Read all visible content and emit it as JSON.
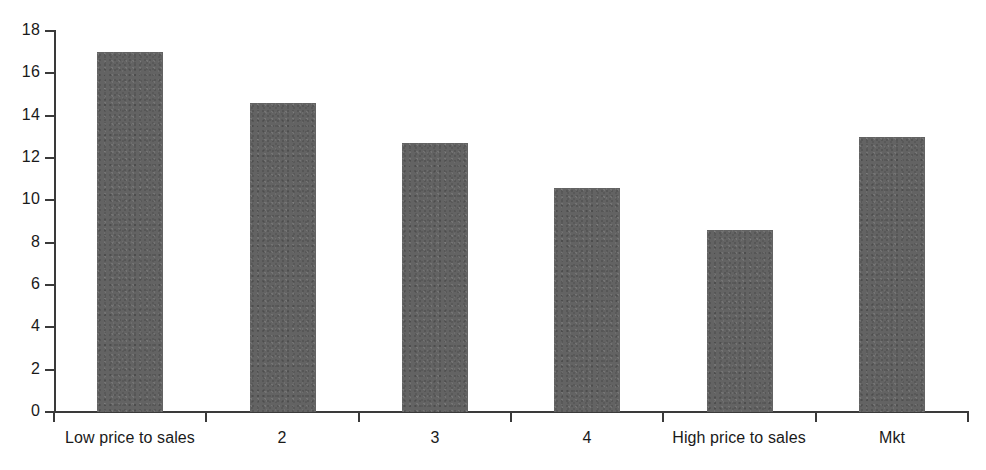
{
  "chart_data": {
    "type": "bar",
    "title": "",
    "subtitle": "",
    "xlabel": "",
    "ylabel": "",
    "categories": [
      "Low price to sales",
      "2",
      "3",
      "4",
      "High price to sales",
      "Mkt"
    ],
    "values": [
      17.0,
      14.6,
      12.7,
      10.6,
      8.6,
      13.0
    ],
    "series": [
      {
        "name": "",
        "values": [
          17.0,
          14.6,
          12.7,
          10.6,
          8.6,
          13.0
        ]
      }
    ],
    "ylim": [
      0,
      18
    ],
    "ytick_labels": [
      "0",
      "2",
      "4",
      "6",
      "8",
      "10",
      "12",
      "14",
      "16",
      "18"
    ],
    "ytick_values": [
      0,
      2,
      4,
      6,
      8,
      10,
      12,
      14,
      16,
      18
    ],
    "ytick_step": 2,
    "grid": false,
    "legend": false,
    "legend_position": "none",
    "bar_color": "#636363",
    "axis_color": "#3a3a3a",
    "background_color": "#ffffff",
    "data_labels": false
  }
}
